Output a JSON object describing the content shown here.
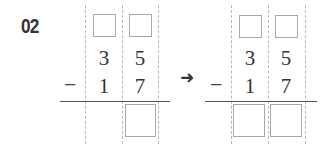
{
  "problem": {
    "number": "02"
  },
  "left_problem": {
    "minuend": [
      "3",
      "5"
    ],
    "subtrahend": [
      "1",
      "7"
    ],
    "operator": "−",
    "carry_boxes": 2,
    "answer_boxes": 1
  },
  "arrow": "➜",
  "right_problem": {
    "minuend": [
      "3",
      "5"
    ],
    "subtrahend": [
      "1",
      "7"
    ],
    "operator": "−",
    "carry_boxes": 2,
    "answer_boxes": 2
  },
  "colors": {
    "text": "#333333",
    "box_border": "#a8a8a8",
    "dashed_guide": "#b8b8b8",
    "rule": "#555555"
  }
}
